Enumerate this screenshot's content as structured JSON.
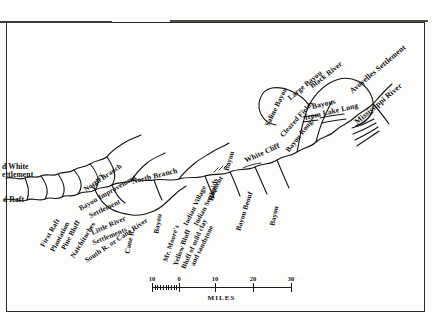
{
  "map": {
    "title": "Red River course map with settlements and bayous",
    "ink_color": "#111111",
    "paper_color": "#fdfdfc",
    "labels": [
      {
        "id": "second-white-settlement",
        "text": "d White\nettlement",
        "x": 2,
        "y": 163,
        "rot": 0,
        "size": 7.6
      },
      {
        "id": "second-raft",
        "text": "d Raft",
        "x": 3,
        "y": 196,
        "rot": 0,
        "size": 7.6
      },
      {
        "id": "first-raft",
        "text": "First Raft",
        "x": 43,
        "y": 243,
        "rot": -60,
        "size": 7.2
      },
      {
        "id": "plantation",
        "text": "Plantation",
        "x": 53,
        "y": 248,
        "rot": -62,
        "size": 7.2
      },
      {
        "id": "pine-bluff",
        "text": "Pine Bluff",
        "x": 64,
        "y": 246,
        "rot": -62,
        "size": 7.2
      },
      {
        "id": "natchitoches",
        "text": "Natchitoches",
        "x": 73,
        "y": 254,
        "rot": -58,
        "size": 7.2
      },
      {
        "id": "ferry",
        "text": "Ferry",
        "x": 94,
        "y": 186,
        "rot": -62,
        "size": 7.2
      },
      {
        "id": "north-branch-west",
        "text": "North Branch",
        "x": 85,
        "y": 187,
        "rot": -34,
        "size": 7.2
      },
      {
        "id": "bayou-improvement",
        "text": "Bayou  Improvement",
        "x": 80,
        "y": 206,
        "rot": -30,
        "size": 7.2
      },
      {
        "id": "settlement",
        "text": "Settlement",
        "x": 90,
        "y": 213,
        "rot": -26,
        "size": 7.2
      },
      {
        "id": "little-river",
        "text": "Little River",
        "x": 92,
        "y": 230,
        "rot": -24,
        "size": 7.2
      },
      {
        "id": "settlements",
        "text": "Settlements",
        "x": 93,
        "y": 240,
        "rot": -22,
        "size": 7.2
      },
      {
        "id": "south-r-or-cane-river",
        "text": "South R. or Cane River",
        "x": 86,
        "y": 258,
        "rot": -34,
        "size": 7.2
      },
      {
        "id": "cane-r",
        "text": "Cane R.",
        "x": 128,
        "y": 250,
        "rot": -78,
        "size": 7.2
      },
      {
        "id": "north-branch-mid",
        "text": "North Branch",
        "x": 132,
        "y": 178,
        "rot": -14,
        "size": 7.6
      },
      {
        "id": "bayou-mid",
        "text": "Bayou",
        "x": 157,
        "y": 230,
        "rot": -80,
        "size": 7.2
      },
      {
        "id": "mr-moores",
        "text": "Mr. Moore's",
        "x": 166,
        "y": 258,
        "rot": -72,
        "size": 7.0
      },
      {
        "id": "yellow-bluff",
        "text": "Yellow Bluff",
        "x": 176,
        "y": 262,
        "rot": -70,
        "size": 7.0
      },
      {
        "id": "bluff-of-mild-clay",
        "text": "Bluff of mild clay",
        "x": 184,
        "y": 265,
        "rot": -66,
        "size": 7.0
      },
      {
        "id": "and-sandstone",
        "text": "and sandstone",
        "x": 193,
        "y": 262,
        "rot": -64,
        "size": 7.0
      },
      {
        "id": "indian-village",
        "text": "Indian Village",
        "x": 186,
        "y": 222,
        "rot": -64,
        "size": 7.0
      },
      {
        "id": "indian-settlement",
        "text": "Indian Settlement",
        "x": 196,
        "y": 222,
        "rot": -62,
        "size": 7.0
      },
      {
        "id": "rapids",
        "text": "Rapids",
        "x": 211,
        "y": 197,
        "rot": -78,
        "size": 7.4
      },
      {
        "id": "bayou-beouf",
        "text": "Bayou Beouf",
        "x": 239,
        "y": 227,
        "rot": -72,
        "size": 7.2
      },
      {
        "id": "bayou-right",
        "text": "Bayou",
        "x": 273,
        "y": 222,
        "rot": -78,
        "size": 7.2
      },
      {
        "id": "bayou-white-cliff",
        "text": "Bayou",
        "x": 227,
        "y": 167,
        "rot": -72,
        "size": 7.2
      },
      {
        "id": "white-cliff",
        "text": "White Cliff",
        "x": 245,
        "y": 157,
        "rot": -24,
        "size": 7.6
      },
      {
        "id": "bayou-rouge",
        "text": "Bayou  Rouge",
        "x": 288,
        "y": 148,
        "rot": -52,
        "size": 7.2
      },
      {
        "id": "cleared-fields",
        "text": "Cleared  Fields",
        "x": 282,
        "y": 133,
        "rot": -48,
        "size": 7.2
      },
      {
        "id": "saline-bayou",
        "text": "Saline Bayou",
        "x": 267,
        "y": 122,
        "rot": -64,
        "size": 7.4
      },
      {
        "id": "large-bayou",
        "text": "Large Bayou",
        "x": 289,
        "y": 95,
        "rot": -40,
        "size": 7.4
      },
      {
        "id": "black-river",
        "text": "Black River",
        "x": 311,
        "y": 83,
        "rot": -38,
        "size": 7.4
      },
      {
        "id": "bayous-from-lake-long",
        "text": "Bayous",
        "x": 312,
        "y": 103,
        "rot": -13,
        "size": 7.6
      },
      {
        "id": "from-lake-long",
        "text": "from Lake Long",
        "x": 305,
        "y": 114,
        "rot": -13,
        "size": 7.6
      },
      {
        "id": "avoyelles-settlement",
        "text": "Avoyelles Settlement",
        "x": 351,
        "y": 88,
        "rot": -40,
        "size": 7.8
      },
      {
        "id": "mississippi-river",
        "text": "Mississippi River",
        "x": 356,
        "y": 119,
        "rot": -40,
        "size": 7.8
      }
    ]
  },
  "scale": {
    "caption": "MILES",
    "ticks": [
      {
        "label": "10",
        "pos": 0
      },
      {
        "label": "0",
        "pos": 27
      },
      {
        "label": "10",
        "pos": 63
      },
      {
        "label": "20",
        "pos": 101
      },
      {
        "label": "30",
        "pos": 139
      }
    ]
  }
}
